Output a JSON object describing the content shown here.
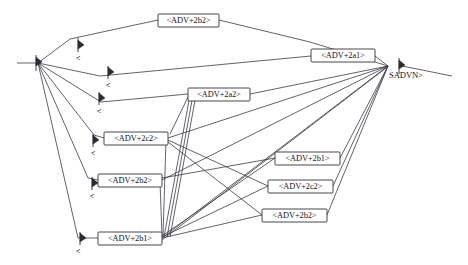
{
  "diagram": {
    "type": "word-lattice",
    "title": "",
    "width": 468,
    "height": 265,
    "colors": {
      "background": "#ffffff",
      "edge": "#3a3a46",
      "node_border": "#33333d",
      "node_fill": "#ffffff",
      "text": "#15151c"
    },
    "start_node": {
      "name": "start-state",
      "x": 38,
      "y": 63
    },
    "end_node": {
      "name": "end-state",
      "x": 388,
      "y": 66,
      "label": "SADVN>"
    },
    "nodes": [
      {
        "id": "n_top",
        "label": "<ADV+2b2>",
        "x": 158,
        "y": 14,
        "w": 61,
        "h": 13
      },
      {
        "id": "n_a1",
        "label": "<ADV+2a1>",
        "x": 311,
        "y": 49,
        "w": 64,
        "h": 13
      },
      {
        "id": "n_a2",
        "label": "<ADV+2a2>",
        "x": 188,
        "y": 88,
        "w": 62,
        "h": 13
      },
      {
        "id": "n_c2_left",
        "label": "<ADV+2c2>",
        "x": 104,
        "y": 132,
        "w": 64,
        "h": 13
      },
      {
        "id": "n_b1_right",
        "label": "<ADV+2b1>",
        "x": 275,
        "y": 152,
        "w": 65,
        "h": 13
      },
      {
        "id": "n_b2_left",
        "label": "<ADV+2b2>",
        "x": 98,
        "y": 174,
        "w": 64,
        "h": 13
      },
      {
        "id": "n_c2_right",
        "label": "<ADV+2c2>",
        "x": 268,
        "y": 180,
        "w": 65,
        "h": 13
      },
      {
        "id": "n_b2_right",
        "label": "<ADV+2b2>",
        "x": 262,
        "y": 209,
        "w": 65,
        "h": 13
      },
      {
        "id": "n_b1_left",
        "label": "<ADV+2b1>",
        "x": 98,
        "y": 232,
        "w": 64,
        "h": 13
      }
    ],
    "chevrons": [
      {
        "label": "<",
        "x": 78,
        "y": 58
      },
      {
        "label": "<",
        "x": 108,
        "y": 85
      },
      {
        "label": "<",
        "x": 99,
        "y": 111
      },
      {
        "label": "<",
        "x": 93,
        "y": 153
      },
      {
        "label": "<",
        "x": 92,
        "y": 196
      },
      {
        "label": "<",
        "x": 78,
        "y": 251
      }
    ],
    "edge_count": 28
  }
}
